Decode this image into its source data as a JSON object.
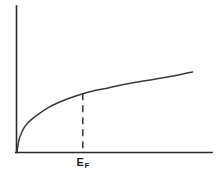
{
  "figure": {
    "background_color": "#ffffff",
    "line_color": "#3a3a3a",
    "axis_color": "#2b2b2b"
  },
  "annotations": {
    "fermi_symbol": "E",
    "fermi_subscript": "F"
  },
  "chart_data": {
    "type": "line",
    "title": "",
    "subtitle": "",
    "xlabel": "",
    "ylabel": "",
    "xlim": [
      0,
      1
    ],
    "ylim": [
      0,
      1
    ],
    "grid": false,
    "legend": null,
    "legend_position": "none",
    "axes_style": "open-left-bottom-spines",
    "tick_labels_x": [],
    "tick_labels_y": [],
    "series": [
      {
        "name": "density-of-states",
        "shape": "square-root",
        "description": "monotonically increasing concave curve rising steeply from the origin then flattening",
        "x": [
          0.0,
          0.01,
          0.02,
          0.04,
          0.06,
          0.09,
          0.12,
          0.16,
          0.2,
          0.25,
          0.31,
          0.38,
          0.45,
          0.52,
          0.6,
          0.68,
          0.76,
          0.84,
          0.92,
          1.0
        ],
        "y": [
          0.0,
          0.14,
          0.21,
          0.3,
          0.36,
          0.42,
          0.47,
          0.53,
          0.58,
          0.63,
          0.68,
          0.73,
          0.77,
          0.8,
          0.84,
          0.87,
          0.9,
          0.93,
          0.96,
          1.0
        ]
      }
    ],
    "annotations": [
      {
        "kind": "vertical-dashed-line",
        "label": "E_F",
        "x": 0.375,
        "y_from": 0.0,
        "y_to": 0.735,
        "dash_pattern": "7 5"
      }
    ]
  }
}
